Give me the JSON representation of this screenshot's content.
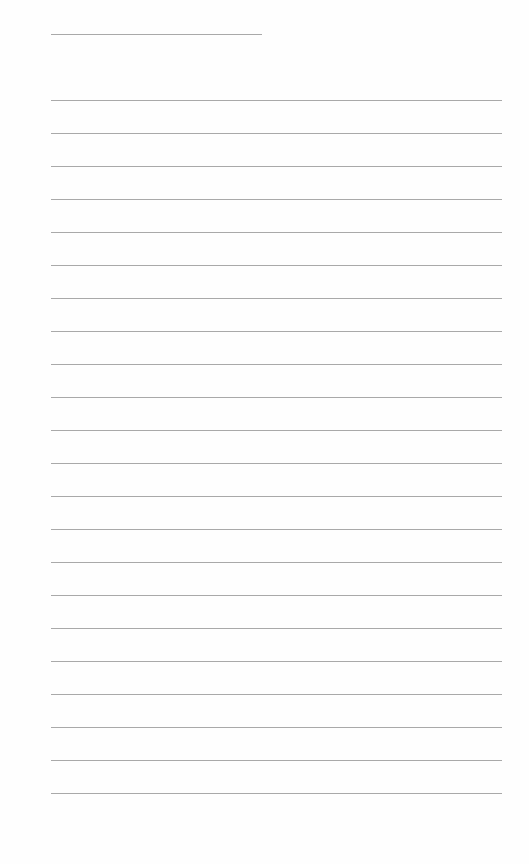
{
  "page": {
    "type": "lined-paper",
    "background": "#ffffff",
    "line_color": "#a9a9a9"
  },
  "header_rule": {
    "x": 51,
    "y": 34,
    "width": 211
  },
  "ruled_lines": {
    "count": 22,
    "x": 51,
    "width": 451,
    "first_y": 100,
    "spacing": 33,
    "ys": [
      100,
      133,
      166,
      199,
      232,
      265,
      298,
      331,
      364,
      397,
      430,
      463,
      496,
      529,
      562,
      595,
      628,
      661,
      694,
      727,
      760,
      793
    ]
  }
}
